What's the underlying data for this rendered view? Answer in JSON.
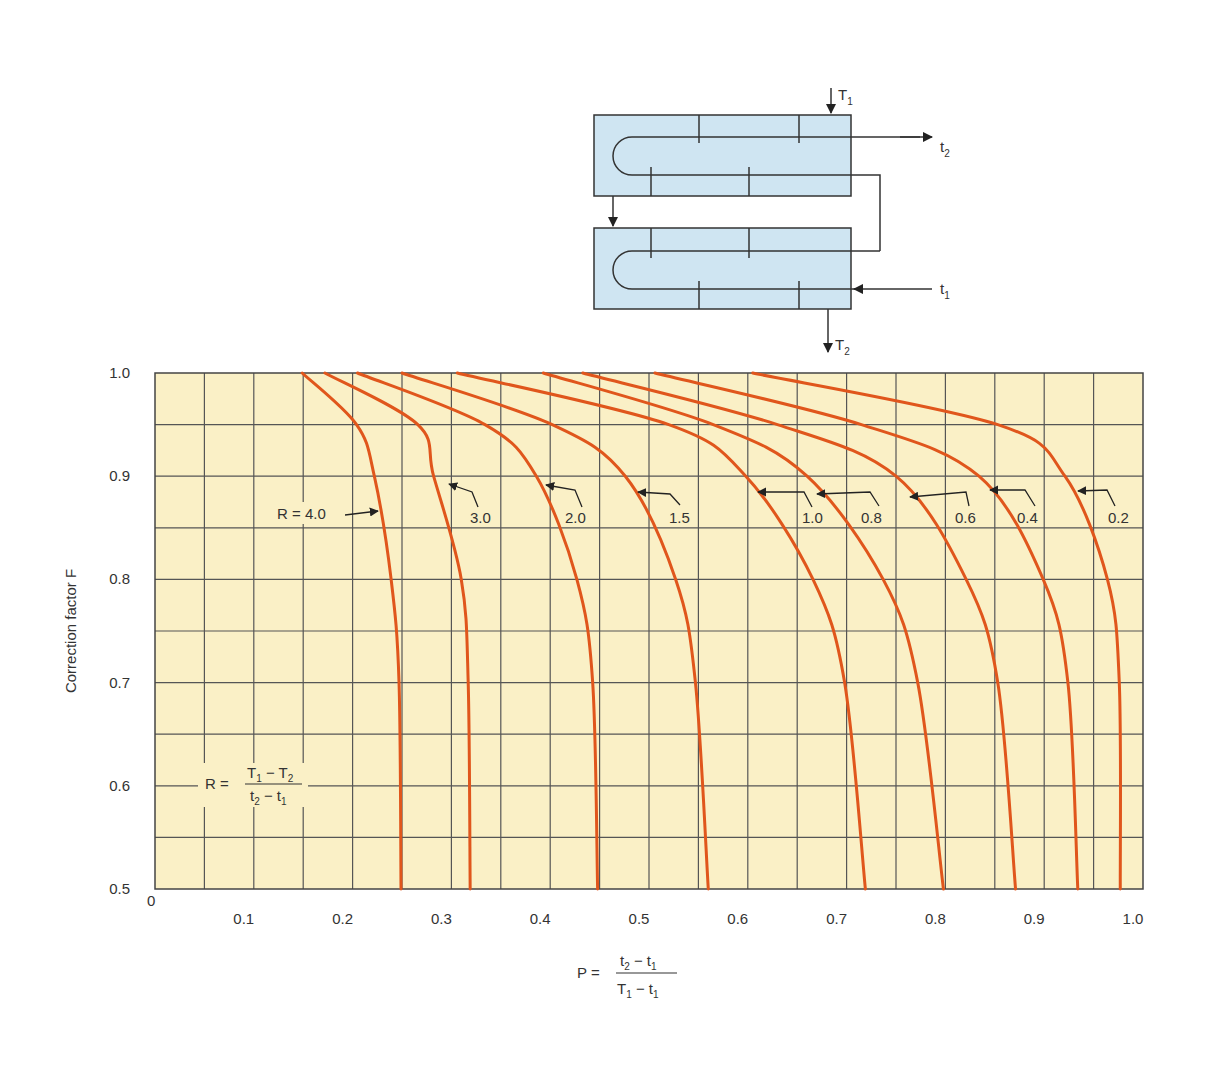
{
  "chart_data": {
    "type": "line",
    "title": "",
    "xlabel": "P = (t2 - t1) / (T1 - t1)",
    "ylabel": "Correction factor F",
    "xlim": [
      0,
      1.0
    ],
    "ylim": [
      0.5,
      1.0
    ],
    "grid": true,
    "x_ticks": [
      "0",
      "0.1",
      "0.2",
      "0.3",
      "0.4",
      "0.5",
      "0.6",
      "0.7",
      "0.8",
      "0.9",
      "1.0"
    ],
    "y_ticks": [
      "0.5",
      "0.6",
      "0.7",
      "0.8",
      "0.9",
      "1.0"
    ],
    "y_sample": [
      1.0,
      0.95,
      0.9,
      0.8,
      0.7,
      0.5
    ],
    "series": [
      {
        "name": "R = 4.0",
        "label": "R = 4.0",
        "x": [
          0.149,
          0.204,
          0.222,
          0.239,
          0.247,
          0.249
        ],
        "y": [
          1.0,
          0.95,
          0.9,
          0.8,
          0.7,
          0.5
        ]
      },
      {
        "name": "R = 3.0",
        "label": "3.0",
        "x": [
          0.172,
          0.266,
          0.282,
          0.31,
          0.317,
          0.319
        ],
        "y": [
          1.0,
          0.95,
          0.9,
          0.8,
          0.7,
          0.5
        ]
      },
      {
        "name": "R = 2.0",
        "label": "2.0",
        "x": [
          0.205,
          0.334,
          0.386,
          0.427,
          0.443,
          0.448
        ],
        "y": [
          1.0,
          0.95,
          0.9,
          0.8,
          0.7,
          0.5
        ]
      },
      {
        "name": "R = 1.5",
        "label": "1.5",
        "x": [
          0.25,
          0.402,
          0.476,
          0.527,
          0.547,
          0.56
        ],
        "y": [
          1.0,
          0.95,
          0.9,
          0.8,
          0.7,
          0.5
        ]
      },
      {
        "name": "R = 1.0",
        "label": "1.0",
        "x": [
          0.306,
          0.52,
          0.598,
          0.666,
          0.698,
          0.719
        ],
        "y": [
          1.0,
          0.95,
          0.9,
          0.8,
          0.7,
          0.5
        ]
      },
      {
        "name": "R = 0.8",
        "label": "0.8",
        "x": [
          0.393,
          0.565,
          0.66,
          0.737,
          0.772,
          0.798
        ],
        "y": [
          1.0,
          0.95,
          0.9,
          0.8,
          0.7,
          0.5
        ]
      },
      {
        "name": "R = 0.6",
        "label": "0.6",
        "x": [
          0.433,
          0.63,
          0.75,
          0.821,
          0.853,
          0.871
        ],
        "y": [
          1.0,
          0.95,
          0.9,
          0.8,
          0.7,
          0.5
        ]
      },
      {
        "name": "R = 0.4",
        "label": "0.4",
        "x": [
          0.506,
          0.715,
          0.834,
          0.899,
          0.924,
          0.934
        ],
        "y": [
          1.0,
          0.95,
          0.9,
          0.8,
          0.7,
          0.5
        ]
      },
      {
        "name": "R = 0.2",
        "label": "0.2",
        "x": [
          0.605,
          0.853,
          0.921,
          0.964,
          0.976,
          0.977
        ],
        "y": [
          1.0,
          0.95,
          0.9,
          0.8,
          0.7,
          0.5
        ]
      }
    ],
    "annotations": {
      "r_formula": "R = (T1 - T2) / (t2 - t1)",
      "p_formula": "P = (t2 - t1) / (T1 - t1)"
    },
    "colors": {
      "plot_background": "#FAF0C6",
      "curve": "#E0561C",
      "grid": "#555555",
      "exchanger_fill": "#CFE5F2"
    }
  },
  "diagram": {
    "labels": {
      "T1": "T",
      "T1_sub": "1",
      "T2": "T",
      "T2_sub": "2",
      "t1": "t",
      "t1_sub": "1",
      "t2": "t",
      "t2_sub": "2"
    }
  },
  "formulas": {
    "R_prefix": "R =",
    "R_num_a": "T",
    "R_num_a_sub": "1",
    "R_num_op": " − ",
    "R_num_b": "T",
    "R_num_b_sub": "2",
    "R_den_a": "t",
    "R_den_a_sub": "2",
    "R_den_op": " − ",
    "R_den_b": "t",
    "R_den_b_sub": "1",
    "P_prefix": "P =",
    "P_num_a": "t",
    "P_num_a_sub": "2",
    "P_num_op": " − ",
    "P_num_b": "t",
    "P_num_b_sub": "1",
    "P_den_a": "T",
    "P_den_a_sub": "1",
    "P_den_op": " − ",
    "P_den_b": "t",
    "P_den_b_sub": "1"
  }
}
